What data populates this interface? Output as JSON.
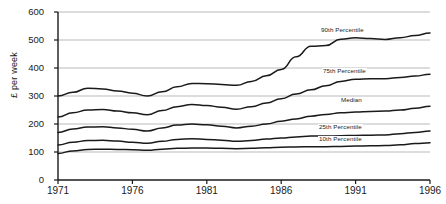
{
  "chart_data": {
    "type": "line",
    "title": "",
    "xlabel": "",
    "ylabel": "£ per week",
    "xlim": [
      1971,
      1996
    ],
    "ylim": [
      0,
      600
    ],
    "xticks": [
      "1971",
      "1976",
      "1981",
      "1986",
      "1991",
      "1996"
    ],
    "xtick_values": [
      1971,
      1976,
      1981,
      1986,
      1991,
      1996
    ],
    "yticks": [
      "0",
      "100",
      "200",
      "300",
      "400",
      "500",
      "600"
    ],
    "ytick_values": [
      0,
      100,
      200,
      300,
      400,
      500,
      600
    ],
    "grid": "horizontal",
    "legend": "inline-labels",
    "line_color": "#1a1a1a",
    "grid_color": "#a8a8a8",
    "axis_color": "#1a1a1a",
    "x": [
      1971,
      1972,
      1973,
      1974,
      1975,
      1976,
      1977,
      1978,
      1979,
      1980,
      1981,
      1982,
      1983,
      1984,
      1985,
      1986,
      1987,
      1988,
      1989,
      1990,
      1991,
      1992,
      1993,
      1994,
      1995,
      1996
    ],
    "series": [
      {
        "name": "90th Percentile",
        "label": "90th Percentile",
        "values": [
          300,
          313,
          328,
          325,
          318,
          310,
          300,
          315,
          333,
          345,
          344,
          341,
          338,
          352,
          372,
          395,
          440,
          478,
          480,
          503,
          508,
          505,
          502,
          508,
          516,
          525
        ]
      },
      {
        "name": "75th Percentile",
        "label": "75th Percentile",
        "values": [
          225,
          240,
          250,
          252,
          246,
          240,
          233,
          248,
          262,
          270,
          266,
          260,
          253,
          262,
          275,
          290,
          307,
          322,
          337,
          352,
          360,
          362,
          362,
          366,
          371,
          378
        ]
      },
      {
        "name": "Median",
        "label": "Median",
        "values": [
          170,
          182,
          189,
          190,
          186,
          181,
          175,
          186,
          196,
          200,
          197,
          192,
          186,
          192,
          200,
          210,
          218,
          228,
          234,
          240,
          243,
          245,
          246,
          250,
          256,
          263
        ]
      },
      {
        "name": "25th Percentile",
        "label": "25th Percentile",
        "values": [
          125,
          135,
          141,
          142,
          139,
          135,
          131,
          138,
          145,
          147,
          145,
          142,
          138,
          141,
          146,
          150,
          154,
          157,
          157,
          158,
          159,
          160,
          161,
          165,
          170,
          175
        ]
      },
      {
        "name": "10th Percentile",
        "label": "10th Percentile",
        "values": [
          95,
          104,
          109,
          110,
          109,
          108,
          106,
          110,
          113,
          114,
          114,
          113,
          112,
          113,
          115,
          117,
          118,
          119,
          119,
          120,
          121,
          122,
          123,
          126,
          130,
          133
        ]
      }
    ],
    "series_label_positions": [
      {
        "name": "90th Percentile",
        "x_px": 320,
        "y_px": 27
      },
      {
        "name": "75th Percentile",
        "x_px": 322,
        "y_px": 68
      },
      {
        "name": "Median",
        "x_px": 340,
        "y_px": 97
      },
      {
        "name": "25th Percentile",
        "x_px": 318,
        "y_px": 124
      },
      {
        "name": "10th Percentile",
        "x_px": 318,
        "y_px": 136
      }
    ]
  }
}
